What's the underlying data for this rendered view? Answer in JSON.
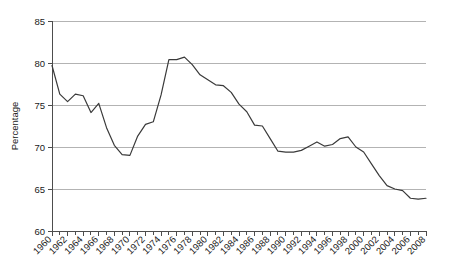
{
  "chart_data": {
    "type": "line",
    "title": "",
    "xlabel": "",
    "ylabel": "Percentage",
    "xlim": [
      1960,
      2008
    ],
    "ylim": [
      60,
      85
    ],
    "ytick_values": [
      60,
      65,
      70,
      75,
      80,
      85
    ],
    "ytick_labels": [
      "60",
      "65",
      "70",
      "75",
      "80",
      "85"
    ],
    "xtick_labels": [
      "1960",
      "1962",
      "1964",
      "1966",
      "1968",
      "1970",
      "1972",
      "1974",
      "1976",
      "1978",
      "1980",
      "1982",
      "1984",
      "1986",
      "1988",
      "1990",
      "1992",
      "1994",
      "1996",
      "1998",
      "2000",
      "2002",
      "2004",
      "2006",
      "2008"
    ],
    "xtick_label_rotation": 45,
    "minor_xticks_every": 1,
    "grid": "horizontal",
    "legend": "none",
    "line_color": "#3a3a3a",
    "grid_color": "#b3b3b3",
    "axis_color": "#4d4d4d",
    "x": [
      1960,
      1961,
      1962,
      1963,
      1964,
      1965,
      1966,
      1967,
      1968,
      1969,
      1970,
      1971,
      1972,
      1973,
      1974,
      1975,
      1976,
      1977,
      1978,
      1979,
      1980,
      1981,
      1982,
      1983,
      1984,
      1985,
      1986,
      1987,
      1988,
      1989,
      1990,
      1991,
      1992,
      1993,
      1994,
      1995,
      1996,
      1997,
      1998,
      1999,
      2000,
      2001,
      2002,
      2003,
      2004,
      2005,
      2006,
      2007,
      2008
    ],
    "values": [
      79.7,
      76.3,
      75.4,
      76.3,
      76.1,
      74.1,
      75.2,
      72.3,
      70.2,
      69.1,
      69.0,
      71.3,
      72.7,
      73.0,
      76.2,
      80.4,
      80.4,
      80.7,
      79.8,
      78.6,
      78.0,
      77.4,
      77.3,
      76.5,
      75.1,
      74.2,
      72.6,
      72.5,
      71.0,
      69.5,
      69.4,
      69.4,
      69.6,
      70.1,
      70.6,
      70.1,
      70.3,
      71.0,
      71.2,
      70.0,
      69.4,
      68.0,
      66.6,
      65.4,
      65.0,
      64.8,
      63.9,
      63.8,
      63.9
    ]
  }
}
